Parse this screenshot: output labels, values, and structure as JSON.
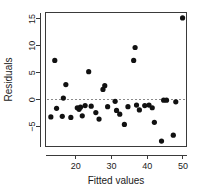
{
  "chart_data": {
    "type": "scatter",
    "title": "",
    "xlabel": "Fitted values",
    "ylabel": "Residuals",
    "xlim": [
      11.5,
      51.0
    ],
    "ylim": [
      -8.7,
      16.2
    ],
    "xticks": [
      20,
      30,
      40,
      50
    ],
    "yticks": [
      -5,
      0,
      5,
      10,
      15
    ],
    "grid": false,
    "legend": false,
    "reference_lines": [
      {
        "orientation": "horizontal",
        "value": 0,
        "style": "dashed",
        "color": "#8a8a8a"
      }
    ],
    "marker": {
      "shape": "filled-circle",
      "color": "#111111",
      "size": 2.6
    },
    "points": [
      {
        "x": 13.0,
        "y": -3.2
      },
      {
        "x": 14.1,
        "y": 7.3
      },
      {
        "x": 14.6,
        "y": -1.6
      },
      {
        "x": 16.2,
        "y": -3.1
      },
      {
        "x": 16.5,
        "y": 0.3
      },
      {
        "x": 17.2,
        "y": 2.8
      },
      {
        "x": 18.6,
        "y": -3.3
      },
      {
        "x": 20.4,
        "y": -1.5
      },
      {
        "x": 20.9,
        "y": -1.8
      },
      {
        "x": 21.3,
        "y": -1.4
      },
      {
        "x": 21.8,
        "y": -3.0
      },
      {
        "x": 22.6,
        "y": -1.1
      },
      {
        "x": 23.6,
        "y": 5.2
      },
      {
        "x": 24.3,
        "y": -1.2
      },
      {
        "x": 25.6,
        "y": -2.4
      },
      {
        "x": 26.5,
        "y": -3.6
      },
      {
        "x": 27.6,
        "y": 1.9
      },
      {
        "x": 28.1,
        "y": 2.6
      },
      {
        "x": 28.9,
        "y": -1.3
      },
      {
        "x": 31.0,
        "y": -0.3
      },
      {
        "x": 31.4,
        "y": -2.0
      },
      {
        "x": 32.3,
        "y": -2.7
      },
      {
        "x": 33.6,
        "y": -4.6
      },
      {
        "x": 34.6,
        "y": -1.3
      },
      {
        "x": 36.2,
        "y": 7.3
      },
      {
        "x": 36.6,
        "y": 9.7
      },
      {
        "x": 37.0,
        "y": -1.0
      },
      {
        "x": 37.8,
        "y": -1.9
      },
      {
        "x": 39.3,
        "y": -1.1
      },
      {
        "x": 40.5,
        "y": -1.0
      },
      {
        "x": 41.4,
        "y": -1.5
      },
      {
        "x": 42.0,
        "y": -4.2
      },
      {
        "x": 44.0,
        "y": -7.7
      },
      {
        "x": 44.6,
        "y": -0.1
      },
      {
        "x": 45.4,
        "y": -0.1
      },
      {
        "x": 47.3,
        "y": -6.6
      },
      {
        "x": 48.0,
        "y": -0.4
      },
      {
        "x": 49.9,
        "y": 15.2
      }
    ]
  }
}
